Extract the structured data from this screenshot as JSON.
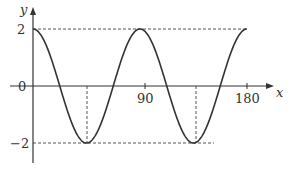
{
  "chart_data": {
    "type": "line",
    "title": "",
    "function": "y = 2cos(4x)",
    "xlabel": "x",
    "ylabel": "y",
    "x_ticks": [
      90,
      180
    ],
    "y_ticks": [
      2,
      0,
      -2
    ],
    "xlim": [
      0,
      180
    ],
    "ylim": [
      -2,
      2
    ],
    "grid": false,
    "series": [
      {
        "name": "y = 2cos(4x)",
        "x": [
          0,
          22.5,
          45,
          67.5,
          90,
          112.5,
          135,
          157.5,
          180
        ],
        "values": [
          2,
          0,
          -2,
          0,
          2,
          0,
          -2,
          0,
          2
        ]
      }
    ],
    "annotations": {
      "dashed_horizontal": [
        {
          "y": 2,
          "from_x": 0,
          "to_x": 180
        },
        {
          "y": -2,
          "from_x": 0,
          "to_x": 153
        }
      ],
      "dashed_vertical": [
        {
          "x": 45,
          "from_y": 0,
          "to_y": -2
        },
        {
          "x": 135,
          "from_y": 0,
          "to_y": -2
        }
      ]
    }
  },
  "labels": {
    "y_axis": "y",
    "x_axis": "x",
    "tick_2": "2",
    "tick_0": "0",
    "tick_neg2": "−2",
    "tick_90": "90",
    "tick_180": "180"
  },
  "colors": {
    "curve": "#333333",
    "axis": "#333333",
    "dash": "#555555"
  }
}
